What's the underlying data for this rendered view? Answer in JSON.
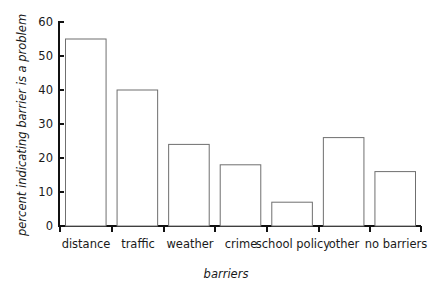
{
  "chart_data": {
    "type": "bar",
    "title": "",
    "subtitle": "",
    "xlabel": "barriers",
    "ylabel": "percent indicating barrier is a problem",
    "categories": [
      "distance",
      "traffic",
      "weather",
      "crime",
      "school policy",
      "other",
      "no barriers"
    ],
    "values": [
      55,
      40,
      24,
      18,
      7,
      26,
      16
    ],
    "ylim": [
      0,
      60
    ],
    "yticks": [
      0,
      10,
      20,
      30,
      40,
      50,
      60
    ],
    "ytick_labels": [
      "0",
      "10",
      "20",
      "30",
      "40",
      "50",
      "60"
    ],
    "grid": false,
    "legend": false,
    "legend_position": "none",
    "bar_fill_color": "#ffffff",
    "bar_edge_color": "#6f6f6f",
    "axis_color": "#111111",
    "text_color": "#1a1a1a",
    "background_color": "#ffffff",
    "annotations": []
  }
}
